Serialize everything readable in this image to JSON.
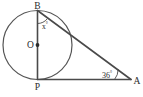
{
  "figure": {
    "type": "circle-tangent-triangle-geometry-diagram",
    "background_color": "#ffffff",
    "line_color": "#4a4a4a",
    "label_color": "#2b2b2b",
    "labels": {
      "top_vertex": "B",
      "center": "O",
      "bottom_vertex": "P",
      "right_vertex": "A"
    },
    "angles": {
      "at_b": "x",
      "at_b_degree_symbol": "°",
      "at_a": "36",
      "at_a_degree_symbol": "°"
    },
    "geometry": {
      "circle_center_x": 37.5,
      "circle_center_y": 45.0,
      "circle_radius": 34.5,
      "point_b_x": 37.5,
      "point_b_y": 10.5,
      "point_p_x": 37.5,
      "point_p_y": 79.5,
      "point_a_x": 131.0,
      "point_a_y": 79.5
    }
  }
}
